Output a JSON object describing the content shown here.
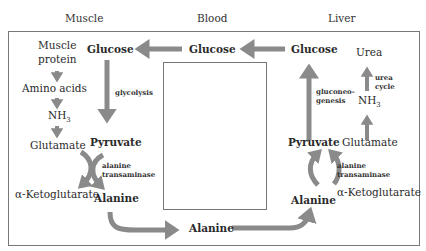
{
  "headers": {
    "muscle": "Muscle",
    "blood": "Blood",
    "liver": "Liver"
  },
  "muscle": {
    "muscle_protein_1": "Muscle",
    "muscle_protein_2": "protein",
    "amino_acids": "Amino acids",
    "nh3": "NH",
    "nh3_sub": "3",
    "glutamate": "Glutamate",
    "alpha_ketoglutarate": "α-Ketoglutarate",
    "glucose": "Glucose",
    "glycolysis": "glycolysis",
    "pyruvate": "Pyruvate",
    "enzyme_1": "alanine",
    "enzyme_2": "transaminase",
    "alanine": "Alanine"
  },
  "blood": {
    "glucose": "Glucose",
    "alanine": "Alanine"
  },
  "liver": {
    "glucose": "Glucose",
    "gluconeogenesis_1": "gluconeo-",
    "gluconeogenesis_2": "genesis",
    "urea": "Urea",
    "urea_cycle_1": "urea",
    "urea_cycle_2": "cycle",
    "nh3": "NH",
    "nh3_sub": "3",
    "pyruvate": "Pyruvate",
    "glutamate": "Glutamate",
    "enzyme_1": "alanine",
    "enzyme_2": "transaminase",
    "alanine": "Alanine",
    "alpha_ketoglutarate": "α-Ketoglutarate"
  },
  "colors": {
    "arrow": "#8a8a8a",
    "frame": "#777777",
    "text": "#2a2a2a"
  }
}
